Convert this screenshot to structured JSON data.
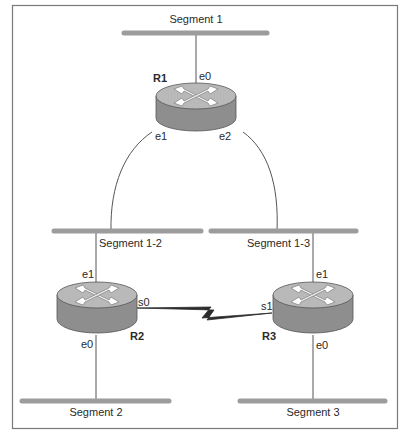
{
  "diagram": {
    "type": "network-topology",
    "colors": {
      "frame": "#7a7a7a",
      "segment": "#9c9c9c",
      "link": "#555555",
      "serial": "#2b2b2b",
      "router_top": "#b9b9b9",
      "router_side": "#8e8e8e",
      "arrow": "#ffffff"
    },
    "segments": [
      {
        "id": "seg1",
        "label": "Segment 1"
      },
      {
        "id": "seg12",
        "label": "Segment 1-2"
      },
      {
        "id": "seg13",
        "label": "Segment 1-3"
      },
      {
        "id": "seg2",
        "label": "Segment 2"
      },
      {
        "id": "seg3",
        "label": "Segment 3"
      }
    ],
    "routers": [
      {
        "id": "R1",
        "label": "R1",
        "interfaces": {
          "e0": "e0",
          "e1": "e1",
          "e2": "e2"
        }
      },
      {
        "id": "R2",
        "label": "R2",
        "interfaces": {
          "e1": "e1",
          "s0": "s0",
          "e0": "e0"
        }
      },
      {
        "id": "R3",
        "label": "R3",
        "interfaces": {
          "e1": "e1",
          "s1": "s1",
          "e0": "e0"
        }
      }
    ],
    "links": [
      {
        "from": "R1.e0",
        "to": "Segment 1",
        "type": "ethernet"
      },
      {
        "from": "R1.e1",
        "to": "Segment 1-2",
        "type": "ethernet"
      },
      {
        "from": "R1.e2",
        "to": "Segment 1-3",
        "type": "ethernet"
      },
      {
        "from": "R2.e1",
        "to": "Segment 1-2",
        "type": "ethernet"
      },
      {
        "from": "R2.e0",
        "to": "Segment 2",
        "type": "ethernet"
      },
      {
        "from": "R3.e1",
        "to": "Segment 1-3",
        "type": "ethernet"
      },
      {
        "from": "R3.e0",
        "to": "Segment 3",
        "type": "ethernet"
      },
      {
        "from": "R2.s0",
        "to": "R3.s1",
        "type": "serial"
      }
    ]
  }
}
